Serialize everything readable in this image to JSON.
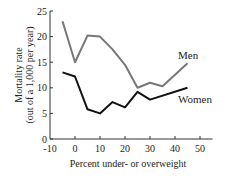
{
  "chart_data": {
    "type": "line",
    "title": "",
    "xlabel": "Percent under- or overweight",
    "ylabel": "Mortality rate",
    "ylabel_sub": "(out of a 1,000 per year)",
    "xlim": [
      -10,
      55
    ],
    "ylim": [
      0,
      25
    ],
    "xticks": [
      -10,
      0,
      10,
      20,
      30,
      40,
      50
    ],
    "yticks": [
      0,
      5,
      10,
      15,
      20,
      25
    ],
    "grid": false,
    "legend": "inline labels",
    "series": [
      {
        "name": "Men",
        "color": "#777777",
        "x": [
          -5,
          0,
          5,
          10,
          15,
          20,
          25,
          30,
          35,
          45
        ],
        "y": [
          23,
          15,
          20.2,
          20,
          17.5,
          14.5,
          10,
          11,
          10.3,
          14.8
        ]
      },
      {
        "name": "Women",
        "color": "#111111",
        "x": [
          -5,
          0,
          5,
          10,
          15,
          20,
          25,
          30,
          45
        ],
        "y": [
          13,
          12.2,
          5.8,
          5,
          7.2,
          6.2,
          9.2,
          7.7,
          10
        ]
      }
    ]
  },
  "labels": {
    "men": "Men",
    "women": "Women"
  }
}
